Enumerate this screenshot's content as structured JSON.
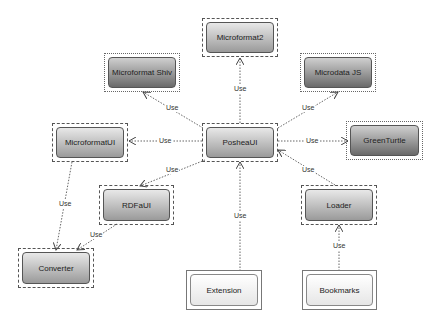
{
  "diagram": {
    "nodes": [
      {
        "id": "microformat2",
        "label": "Microformat2",
        "frame": "dashed"
      },
      {
        "id": "microformat-shiv",
        "label": "Microformat Shiv",
        "frame": "dotted"
      },
      {
        "id": "microdata-js",
        "label": "Microdata JS",
        "frame": "dotted"
      },
      {
        "id": "microformatui",
        "label": "MicroformatUI",
        "frame": "dashed"
      },
      {
        "id": "posheaui",
        "label": "PosheaUI",
        "frame": "dashed"
      },
      {
        "id": "greenturtle",
        "label": "GreenTurtle",
        "frame": "dotted"
      },
      {
        "id": "rdfaui",
        "label": "RDFaUI",
        "frame": "dashed"
      },
      {
        "id": "loader",
        "label": "Loader",
        "frame": "dashed"
      },
      {
        "id": "converter",
        "label": "Converter",
        "frame": "dashed"
      },
      {
        "id": "extension",
        "label": "Extension",
        "frame": "double"
      },
      {
        "id": "bookmarks",
        "label": "Bookmarks",
        "frame": "double"
      }
    ],
    "edges": [
      {
        "from": "posheaui",
        "to": "microformat2",
        "label": "Use"
      },
      {
        "from": "posheaui",
        "to": "microformat-shiv",
        "label": "Use"
      },
      {
        "from": "posheaui",
        "to": "microdata-js",
        "label": "Use"
      },
      {
        "from": "posheaui",
        "to": "microformatui",
        "label": "Use"
      },
      {
        "from": "posheaui",
        "to": "greenturtle",
        "label": "Use"
      },
      {
        "from": "posheaui",
        "to": "rdfaui",
        "label": "Use"
      },
      {
        "from": "loader",
        "to": "posheaui",
        "label": "Use"
      },
      {
        "from": "extension",
        "to": "posheaui",
        "label": "Use"
      },
      {
        "from": "bookmarks",
        "to": "loader",
        "label": "Use"
      },
      {
        "from": "microformatui",
        "to": "converter",
        "label": "Use"
      },
      {
        "from": "rdfaui",
        "to": "converter",
        "label": "Use"
      }
    ]
  }
}
